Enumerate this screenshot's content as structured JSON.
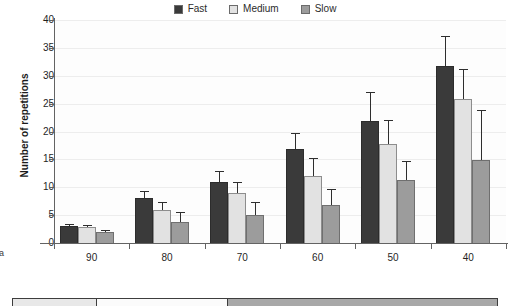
{
  "panel": {
    "letter": "a"
  },
  "legend": {
    "position": "top-center",
    "entries": [
      {
        "label": "Fast",
        "color": "#3a3a3a"
      },
      {
        "label": "Medium",
        "color": "#e2e2e2"
      },
      {
        "label": "Slow",
        "color": "#9c9c9c"
      }
    ]
  },
  "bottom_table": {
    "cells": [
      {
        "width": 84,
        "color": "#e8e8e8"
      },
      {
        "width": 132,
        "color": "#fbfbfb"
      },
      {
        "width": 270,
        "color": "#a8a8a8"
      }
    ]
  },
  "chart_data": {
    "type": "bar",
    "title": "",
    "xlabel": "",
    "ylabel": "Number of repetitions",
    "categories": [
      "90",
      "80",
      "70",
      "60",
      "50",
      "40"
    ],
    "ylim": [
      0,
      40
    ],
    "yticks": [
      0,
      5,
      10,
      15,
      20,
      25,
      30,
      35,
      40
    ],
    "grid": true,
    "legend_position": "top-center",
    "errorbars": "one-sided-upper",
    "series": [
      {
        "name": "Fast",
        "color": "#3a3a3a",
        "values": [
          3.0,
          8.0,
          11.0,
          16.8,
          21.8,
          31.8
        ],
        "errors": [
          0.4,
          1.3,
          2.0,
          3.0,
          5.2,
          5.3
        ]
      },
      {
        "name": "Medium",
        "color": "#e2e2e2",
        "values": [
          2.8,
          6.0,
          9.0,
          12.0,
          17.8,
          25.8
        ],
        "errors": [
          0.4,
          1.3,
          2.0,
          3.3,
          4.3,
          5.4
        ]
      },
      {
        "name": "Slow",
        "color": "#9c9c9c",
        "values": [
          2.0,
          3.8,
          5.0,
          6.9,
          11.3,
          14.9
        ],
        "errors": [
          0.4,
          1.8,
          2.4,
          2.8,
          3.4,
          8.9
        ]
      }
    ]
  }
}
